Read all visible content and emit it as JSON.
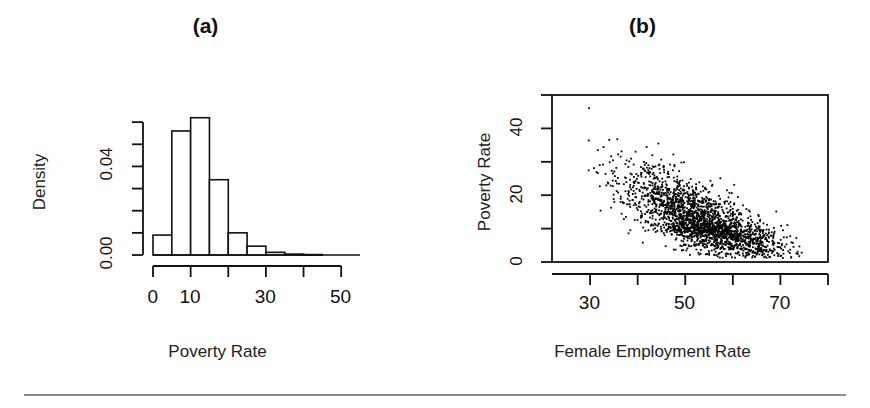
{
  "figure": {
    "background": "#ffffff",
    "line_color": "#111111",
    "point_color": "#000000",
    "rule_color": "#8d8d8d"
  },
  "panels": [
    {
      "id": "a",
      "label": "(a)",
      "xlabel": "Poverty Rate",
      "ylabel": "Density"
    },
    {
      "id": "b",
      "label": "(b)",
      "xlabel": "Female Employment Rate",
      "ylabel": "Poverty Rate"
    }
  ],
  "chart_data": [
    {
      "type": "bar",
      "subtype": "histogram",
      "panel": "(a)",
      "title": "(a)",
      "xlabel": "Poverty Rate",
      "ylabel": "Density",
      "xlim": [
        0,
        55
      ],
      "ylim": [
        0,
        0.07
      ],
      "grid": false,
      "legend": null,
      "bin_width": 5,
      "bin_edges": [
        0,
        5,
        10,
        15,
        20,
        25,
        30,
        35,
        40,
        45
      ],
      "categories": [
        "0-5",
        "5-10",
        "10-15",
        "15-20",
        "20-25",
        "25-30",
        "30-35",
        "35-40",
        "40-45"
      ],
      "values": [
        0.009,
        0.056,
        0.062,
        0.034,
        0.01,
        0.004,
        0.0012,
        0.0004,
        0.0002
      ],
      "xticks": [
        0,
        10,
        20,
        30,
        40,
        50
      ],
      "xtick_labels": [
        "0",
        "10",
        "",
        "30",
        "",
        "50"
      ],
      "yticks": [
        0.0,
        0.01,
        0.02,
        0.03,
        0.04,
        0.05,
        0.06
      ],
      "ytick_labels": [
        "0.00",
        "",
        "",
        "",
        "0.04",
        "",
        ""
      ]
    },
    {
      "type": "scatter",
      "panel": "(b)",
      "title": "(b)",
      "xlabel": "Female Employment Rate",
      "ylabel": "Poverty Rate",
      "xlim": [
        22,
        80
      ],
      "ylim": [
        0,
        50
      ],
      "grid": false,
      "legend": null,
      "box_frame": true,
      "n_points": 2200,
      "correlation": -0.72,
      "xticks": [
        30,
        40,
        50,
        60,
        70,
        80
      ],
      "xtick_labels": [
        "30",
        "",
        "50",
        "",
        "70",
        ""
      ],
      "yticks": [
        0,
        10,
        20,
        30,
        40,
        50
      ],
      "ytick_labels": [
        "0",
        "",
        "20",
        "",
        "40",
        ""
      ],
      "cluster_center": [
        54,
        11
      ],
      "description": "Dense negatively correlated cloud of points; poverty rate decreases as female employment rate increases"
    }
  ]
}
